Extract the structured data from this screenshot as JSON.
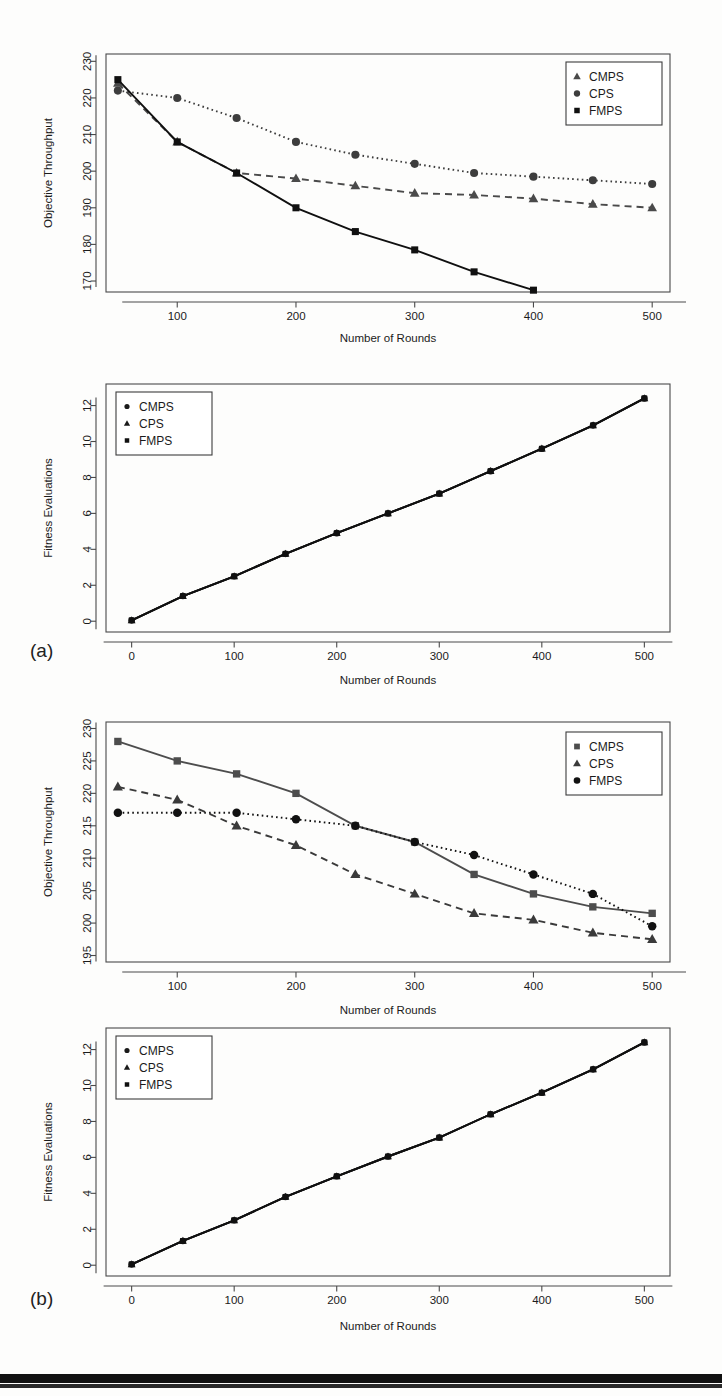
{
  "figure": {
    "panel_a_label": "(a)",
    "panel_b_label": "(b)"
  },
  "chart_data": [
    {
      "id": "a-top",
      "type": "line",
      "title": "",
      "xlabel": "Number of Rounds",
      "ylabel": "Objective Throughput",
      "xlim": [
        40,
        515
      ],
      "ylim": [
        167,
        232
      ],
      "xticks": [
        100,
        200,
        300,
        400,
        500
      ],
      "yticks": [
        170,
        180,
        190,
        200,
        210,
        220,
        230
      ],
      "grid": false,
      "legend_position": "top-right",
      "x": [
        50,
        100,
        150,
        200,
        250,
        300,
        350,
        400,
        450,
        500
      ],
      "series": [
        {
          "name": "CMPS",
          "marker": "triangle",
          "linestyle": "dashed",
          "color": "#4a4a4a",
          "values": [
            224.0,
            208.0,
            199.5,
            198.0,
            196.0,
            194.0,
            193.5,
            192.5,
            191.0,
            190.0
          ]
        },
        {
          "name": "CPS",
          "marker": "circle",
          "linestyle": "dotted",
          "color": "#3d3d3d",
          "values": [
            222.0,
            220.0,
            214.5,
            208.0,
            204.5,
            202.0,
            199.5,
            198.5,
            197.5,
            196.5
          ]
        },
        {
          "name": "FMPS",
          "marker": "square",
          "linestyle": "solid",
          "color": "#101010",
          "values": [
            225.0,
            208.0,
            199.5,
            190.0,
            183.5,
            178.5,
            172.5,
            167.5,
            null,
            null
          ]
        }
      ]
    },
    {
      "id": "a-bottom",
      "type": "line",
      "title": "",
      "xlabel": "Number of Rounds",
      "ylabel": "Fitness Evaluations",
      "xlim": [
        -25,
        525
      ],
      "ylim": [
        -0.6,
        13.2
      ],
      "xticks": [
        0,
        100,
        200,
        300,
        400,
        500
      ],
      "yticks": [
        0,
        2,
        4,
        6,
        8,
        10,
        12
      ],
      "grid": false,
      "legend_position": "top-left",
      "x": [
        0,
        50,
        100,
        150,
        200,
        250,
        300,
        350,
        400,
        450,
        500
      ],
      "series": [
        {
          "name": "CMPS",
          "marker": "circle",
          "linestyle": "solid",
          "color": "#1a1a1a",
          "values": [
            0.05,
            1.4,
            2.5,
            3.75,
            4.9,
            6.0,
            7.1,
            8.35,
            9.6,
            10.9,
            12.4
          ]
        },
        {
          "name": "CPS",
          "marker": "triangle",
          "linestyle": "solid",
          "color": "#1a1a1a",
          "values": [
            0.05,
            1.4,
            2.5,
            3.75,
            4.9,
            6.0,
            7.1,
            8.35,
            9.6,
            10.9,
            12.4
          ]
        },
        {
          "name": "FMPS",
          "marker": "square",
          "linestyle": "solid",
          "color": "#101010",
          "values": [
            0.05,
            1.4,
            2.5,
            3.75,
            4.9,
            6.0,
            7.1,
            8.35,
            9.6,
            10.9,
            12.4
          ]
        }
      ]
    },
    {
      "id": "b-top",
      "type": "line",
      "title": "",
      "xlabel": "Number of Rounds",
      "ylabel": "Objective Throughput",
      "xlim": [
        40,
        515
      ],
      "ylim": [
        194,
        231
      ],
      "xticks": [
        100,
        200,
        300,
        400,
        500
      ],
      "yticks": [
        195,
        200,
        205,
        210,
        215,
        220,
        225,
        230
      ],
      "grid": false,
      "legend_position": "top-right",
      "x": [
        50,
        100,
        150,
        200,
        250,
        300,
        350,
        400,
        450,
        500
      ],
      "series": [
        {
          "name": "CMPS",
          "marker": "square",
          "linestyle": "solid",
          "color": "#4d4d4d",
          "values": [
            228.0,
            225.0,
            223.0,
            220.0,
            215.0,
            212.5,
            207.5,
            204.5,
            202.5,
            201.5
          ]
        },
        {
          "name": "CPS",
          "marker": "triangle",
          "linestyle": "dashed",
          "color": "#3a3a3a",
          "values": [
            221.0,
            219.0,
            215.0,
            212.0,
            207.5,
            204.5,
            201.5,
            200.5,
            198.5,
            197.5
          ]
        },
        {
          "name": "FMPS",
          "marker": "circle",
          "linestyle": "dotted",
          "color": "#111111",
          "values": [
            217.0,
            217.0,
            217.0,
            216.0,
            215.0,
            212.5,
            210.5,
            207.5,
            204.5,
            199.5
          ]
        }
      ]
    },
    {
      "id": "b-bottom",
      "type": "line",
      "title": "",
      "xlabel": "Number of Rounds",
      "ylabel": "Fitness Evaluations",
      "xlim": [
        -25,
        525
      ],
      "ylim": [
        -0.6,
        13.2
      ],
      "xticks": [
        0,
        100,
        200,
        300,
        400,
        500
      ],
      "yticks": [
        0,
        2,
        4,
        6,
        8,
        10,
        12
      ],
      "grid": false,
      "legend_position": "top-left",
      "x": [
        0,
        50,
        100,
        150,
        200,
        250,
        300,
        350,
        400,
        450,
        500
      ],
      "series": [
        {
          "name": "CMPS",
          "marker": "circle",
          "linestyle": "solid",
          "color": "#1a1a1a",
          "values": [
            0.05,
            1.35,
            2.5,
            3.8,
            4.95,
            6.05,
            7.1,
            8.4,
            9.6,
            10.9,
            12.4
          ]
        },
        {
          "name": "CPS",
          "marker": "triangle",
          "linestyle": "solid",
          "color": "#1a1a1a",
          "values": [
            0.05,
            1.35,
            2.5,
            3.8,
            4.95,
            6.05,
            7.1,
            8.4,
            9.6,
            10.9,
            12.4
          ]
        },
        {
          "name": "FMPS",
          "marker": "square",
          "linestyle": "solid",
          "color": "#101010",
          "values": [
            0.05,
            1.35,
            2.5,
            3.8,
            4.95,
            6.05,
            7.1,
            8.4,
            9.6,
            10.9,
            12.4
          ]
        }
      ]
    }
  ]
}
